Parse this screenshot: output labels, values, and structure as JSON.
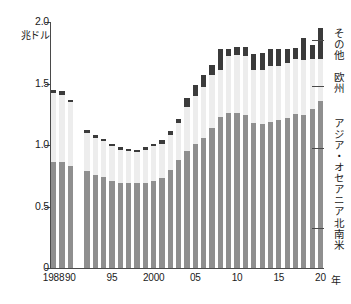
{
  "chart_data": {
    "type": "bar",
    "stacked": true,
    "title": "",
    "subtitle": "",
    "xlabel": "年",
    "ylabel": "兆ドル",
    "ylim": [
      0,
      2.0
    ],
    "yticks": [
      0,
      0.5,
      1.0,
      1.5,
      2.0
    ],
    "ytick_labels": [
      "0",
      "0.5",
      "1.0",
      "1.5",
      "2.0"
    ],
    "grid": false,
    "legend_position": "right-inline-labels",
    "categories": [
      "1988",
      "1989",
      "1990",
      "1992",
      "1993",
      "1994",
      "1995",
      "1996",
      "1997",
      "1998",
      "1999",
      "2000",
      "2001",
      "2002",
      "2003",
      "2004",
      "2005",
      "2006",
      "2007",
      "2008",
      "2009",
      "2010",
      "2011",
      "2012",
      "2013",
      "2014",
      "2015",
      "2016",
      "2017",
      "2018",
      "2019",
      "2020"
    ],
    "xtick_labels": [
      {
        "label": "1988",
        "category": "1988"
      },
      {
        "label": "90",
        "category": "1990"
      },
      {
        "label": "95",
        "category": "1995"
      },
      {
        "label": "2000",
        "category": "2000"
      },
      {
        "label": "05",
        "category": "2005"
      },
      {
        "label": "10",
        "category": "2010"
      },
      {
        "label": "15",
        "category": "2015"
      },
      {
        "label": "20",
        "category": "2020"
      }
    ],
    "series": [
      {
        "name": "北南米",
        "color": "#8f8f8f",
        "values": [
          0.86,
          0.86,
          0.83,
          0.79,
          0.76,
          0.74,
          0.71,
          0.69,
          0.69,
          0.69,
          0.69,
          0.71,
          0.73,
          0.8,
          0.88,
          0.95,
          1.01,
          1.06,
          1.14,
          1.23,
          1.26,
          1.26,
          1.24,
          1.18,
          1.17,
          1.19,
          1.2,
          1.22,
          1.25,
          1.24,
          1.29,
          1.36
        ]
      },
      {
        "name": "アジア・オセアニア",
        "color": "#9a9a9a",
        "values": [
          0.0,
          0.0,
          0.0,
          0.0,
          0.0,
          0.0,
          0.0,
          0.0,
          0.0,
          0.0,
          0.0,
          0.0,
          0.0,
          0.0,
          0.0,
          0.0,
          0.0,
          0.0,
          0.0,
          0.0,
          0.0,
          0.0,
          0.0,
          0.0,
          0.0,
          0.0,
          0.0,
          0.0,
          0.0,
          0.0,
          0.0,
          0.0
        ]
      },
      {
        "name": "欧州",
        "color": "#ededed",
        "values": [
          0.56,
          0.55,
          0.52,
          0.31,
          0.3,
          0.29,
          0.28,
          0.27,
          0.26,
          0.25,
          0.27,
          0.28,
          0.28,
          0.28,
          0.3,
          0.36,
          0.39,
          0.41,
          0.43,
          0.38,
          0.46,
          0.47,
          0.48,
          0.43,
          0.44,
          0.45,
          0.44,
          0.45,
          0.45,
          0.45,
          0.41,
          0.34
        ]
      },
      {
        "name": "その他",
        "color": "#3b3b3b",
        "values": [
          0.03,
          0.03,
          0.02,
          0.02,
          0.02,
          0.02,
          0.02,
          0.02,
          0.02,
          0.02,
          0.02,
          0.02,
          0.03,
          0.03,
          0.03,
          0.07,
          0.09,
          0.1,
          0.08,
          0.17,
          0.06,
          0.07,
          0.08,
          0.13,
          0.14,
          0.14,
          0.14,
          0.11,
          0.09,
          0.18,
          0.11,
          0.25
        ]
      }
    ],
    "totals": [
      1.45,
      1.44,
      1.37,
      1.12,
      1.08,
      1.05,
      1.01,
      0.98,
      0.97,
      0.96,
      0.98,
      1.01,
      1.04,
      1.11,
      1.21,
      1.38,
      1.49,
      1.57,
      1.65,
      1.78,
      1.78,
      1.8,
      1.8,
      1.74,
      1.75,
      1.78,
      1.78,
      1.78,
      1.79,
      1.87,
      1.81,
      1.95
    ]
  },
  "legend": {
    "items": [
      {
        "label": "その他",
        "color": "#3b3b3b"
      },
      {
        "label": "欧州",
        "color": "#ededed"
      },
      {
        "label": "アジア・オセアニア",
        "color": "#9a9a9a"
      },
      {
        "label": "北南米",
        "color": "#8f8f8f"
      }
    ]
  }
}
